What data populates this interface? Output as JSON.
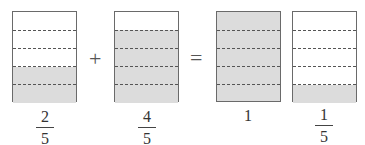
{
  "diagram": {
    "type": "fraction-addition-area-model",
    "equation": "2/5 + 4/5 = 1 + 1/5",
    "operators": {
      "plus": "+",
      "equals": "="
    },
    "boxes": [
      {
        "id": "box1",
        "parts": 5,
        "shaded_parts": 2,
        "label": {
          "numerator": "2",
          "denominator": "5"
        }
      },
      {
        "id": "box2",
        "parts": 5,
        "shaded_parts": 4,
        "label": {
          "numerator": "4",
          "denominator": "5"
        }
      },
      {
        "id": "box3",
        "parts": 5,
        "shaded_parts": 5,
        "label": {
          "whole": "1"
        }
      },
      {
        "id": "box4",
        "parts": 5,
        "shaded_parts": 1,
        "label": {
          "numerator": "1",
          "denominator": "5"
        }
      }
    ],
    "colors": {
      "shaded": "#dcdcdc",
      "unshaded": "#ffffff",
      "border": "#6a6a6a",
      "dash": "#555555"
    }
  }
}
